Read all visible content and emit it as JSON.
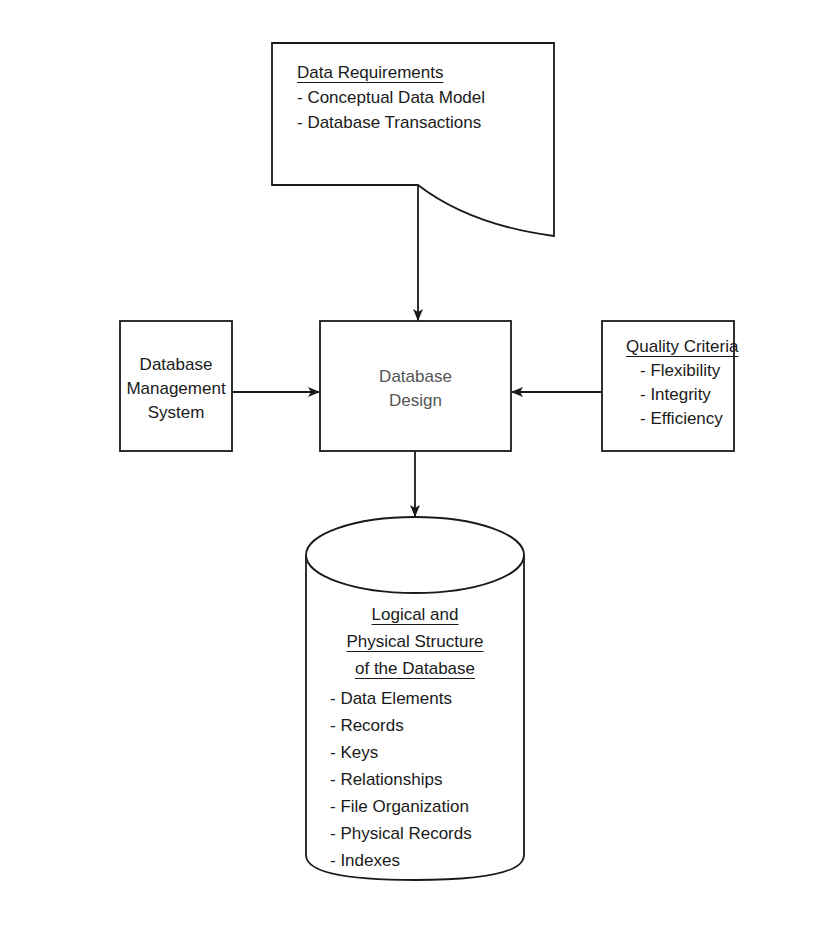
{
  "data_requirements": {
    "title": "Data Requirements",
    "items": [
      "- Conceptual Data Model",
      "- Database Transactions"
    ]
  },
  "dbms": {
    "lines": [
      "Database",
      "Management",
      "System"
    ]
  },
  "design": {
    "lines": [
      "Database",
      "Design"
    ]
  },
  "quality": {
    "title": "Quality Criteria",
    "items": [
      "- Flexibility",
      "- Integrity",
      "- Efficiency"
    ]
  },
  "structure": {
    "title_lines": [
      "Logical and",
      "Physical Structure",
      "of the Database"
    ],
    "items": [
      "- Data Elements",
      "- Records",
      "- Keys",
      "- Relationships",
      "- File Organization",
      "- Physical Records",
      "- Indexes"
    ]
  },
  "colors": {
    "line": "#1a1a1a",
    "background": "#ffffff"
  }
}
